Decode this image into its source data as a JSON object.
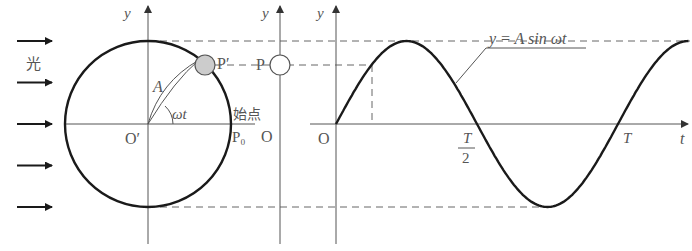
{
  "diagram": {
    "light_label": "光",
    "circle": {
      "center_label": "O′",
      "radius_label": "A",
      "angle_label": "ωt",
      "moving_point_label": "P′",
      "start_point_label": "P₀",
      "start_text": "始点",
      "axis_label": "y"
    },
    "projection": {
      "point_label": "P",
      "origin_label": "O",
      "axis_label": "y"
    },
    "graph": {
      "origin_label": "O",
      "y_axis_label": "y",
      "t_axis_label": "t",
      "half_period_numerator": "T",
      "half_period_denominator": "2",
      "period_label": "T",
      "equation_label": "y = A sin ωt"
    },
    "light_arrow_count": 5,
    "colors": {
      "curve": "#1a1a1a",
      "ball_fill": "#cccccc",
      "text": "#555555"
    }
  },
  "chart_data": {
    "type": "line",
    "title": "",
    "xlabel": "t",
    "ylabel": "y",
    "equation": "y = A sin ωt",
    "x_ticks": [
      "T/2",
      "T"
    ],
    "x_range_periods": [
      0,
      1.25
    ],
    "y_range": [
      "-A",
      "A"
    ],
    "series": [
      {
        "name": "y = A sin ωt",
        "amplitude": 1,
        "periods_shown": 1.25
      }
    ],
    "marked_phase_fraction_of_period": 0.125
  }
}
